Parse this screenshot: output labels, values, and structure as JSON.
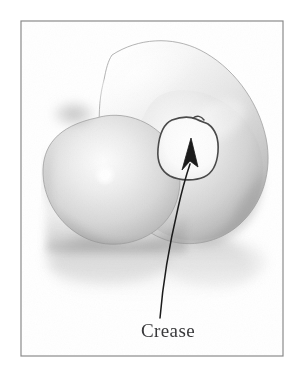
{
  "figure": {
    "kind": "technical-illustration",
    "background_color": "#ffffff",
    "frame": {
      "name": "figure-border",
      "stroke_color": "#8a8a8a",
      "stroke_width": 1.2,
      "x": 21,
      "y": 21,
      "width": 262,
      "height": 335
    },
    "surface": {
      "name": "blended-blob-surface",
      "fill_light": "#fdfdfd",
      "fill_mid": "#e2e2e2",
      "fill_shade": "#b6b6b6",
      "fill_deep": "#9a9a9a",
      "outline_color": "#9f9f9f",
      "upper_lobe": {
        "name": "upper-lobe",
        "description": "elongated rounded lobe tilted down to the right",
        "top_y": 40,
        "left_x": 62,
        "right_x": 270
      },
      "lower_lobe": {
        "name": "lower-lobe",
        "description": "rounder lobe at lower left",
        "left_x": 42,
        "bottom_y": 245
      },
      "notch": {
        "name": "lobe-junction-notch",
        "x": 68,
        "y": 110
      },
      "highlight": {
        "name": "specular-highlight",
        "x": 105,
        "y": 175,
        "radius": 9,
        "color": "#ffffff"
      }
    },
    "reflection": {
      "name": "ground-reflection",
      "color": "#c9c9c9",
      "top_y": 238,
      "bottom_y": 318
    },
    "crease": {
      "name": "crease-outline",
      "description": "hand drawn irregular closed curve marking the crease region",
      "stroke_color": "#4a4a4a",
      "stroke_width": 1.6,
      "interior_color": "#ffffff",
      "bounds": {
        "x": 158,
        "y": 118,
        "width": 60,
        "height": 60
      }
    },
    "arrow": {
      "name": "crease-callout-arrow",
      "stroke_color": "#1b1b1b",
      "stroke_width": 1.6,
      "tip": {
        "x": 191,
        "y": 139
      },
      "tail": {
        "x": 160,
        "y": 318
      }
    },
    "label": {
      "name": "crease-label",
      "text": "Crease",
      "color": "#3a3a3c",
      "font_size_px": 19,
      "center_x": 168,
      "baseline_y": 337
    }
  }
}
